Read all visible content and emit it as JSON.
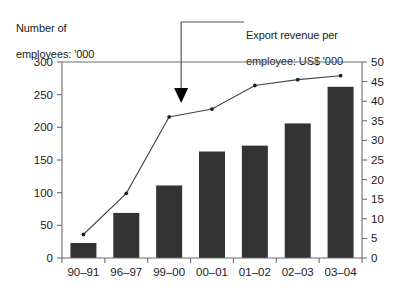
{
  "chart_data": {
    "type": "bar",
    "title": "",
    "categories": [
      "90–91",
      "96–97",
      "99–00",
      "00–01",
      "01–02",
      "02–03",
      "03–04"
    ],
    "series": [
      {
        "name": "Number of employees: '000",
        "type": "bar",
        "axis": "left",
        "values": [
          23,
          69,
          111,
          163,
          172,
          206,
          262
        ]
      },
      {
        "name": "Export revenue per employee: US$ '000",
        "type": "line",
        "axis": "right",
        "values": [
          6,
          16.5,
          36,
          38,
          44,
          45.5,
          46.5
        ]
      }
    ],
    "left_axis": {
      "label": "Number of employees: '000",
      "ylim": [
        0,
        300
      ],
      "ticks": [
        0,
        50,
        100,
        150,
        200,
        250,
        300
      ],
      "tick_labels": [
        "0",
        "50",
        "100",
        "150",
        "200",
        "250",
        "300"
      ]
    },
    "right_axis": {
      "label": "Export revenue per employee: US$ '000",
      "ylim": [
        0,
        50
      ],
      "ticks": [
        0,
        5,
        10,
        15,
        20,
        25,
        30,
        35,
        40,
        45,
        50
      ],
      "tick_labels": [
        "0",
        "5",
        "10",
        "15",
        "20",
        "25",
        "30",
        "35",
        "40",
        "45",
        "50"
      ]
    },
    "xlabel": "",
    "grid": false,
    "legend_position": "annotation",
    "annotations": [
      {
        "text": "Export revenue per employee: US$ '000",
        "points_to_series": "Export revenue per employee: US$ '000",
        "points_to_category": "99–00"
      }
    ],
    "colors": {
      "bar_fill": "#333333",
      "line_stroke": "#444444",
      "axis": "#6e6e6e",
      "text": "#1a1a1a",
      "arrow": "#000000"
    }
  },
  "labels": {
    "left_axis_title_line1": "Number of",
    "left_axis_title_line2": "employees: '000",
    "callout_line1": "Export revenue per",
    "callout_line2": "employee: US$ '000"
  }
}
